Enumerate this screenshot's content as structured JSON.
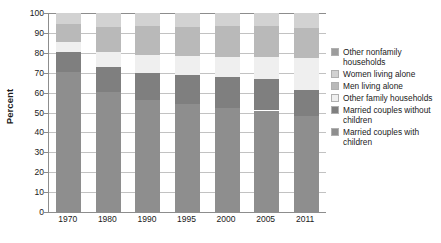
{
  "chart_data": {
    "type": "bar",
    "subtype": "stacked-bar-100-percent",
    "title": "",
    "xlabel": "",
    "ylabel": "Percent",
    "ylim": [
      0,
      100
    ],
    "yticks": [
      0,
      10,
      20,
      30,
      40,
      50,
      60,
      70,
      80,
      90,
      100
    ],
    "grid": true,
    "legend_position": "right",
    "categories": [
      "1970",
      "1980",
      "1990",
      "1995",
      "2000",
      "2005",
      "2011"
    ],
    "series": [
      {
        "name": "Married couples with children",
        "color": "#8e8e8e",
        "values": [
          40.3,
          30.9,
          26.3,
          25.5,
          24.1,
          22.9,
          20.6
        ]
      },
      {
        "name": "Married couples without children",
        "color": "#7f7f7f",
        "values": [
          30.3,
          29.9,
          29.8,
          28.9,
          28.7,
          28.2,
          28.2
        ]
      },
      {
        "name": "Other family households",
        "color": "#efefef",
        "values": [
          10.6,
          12.9,
          14.8,
          15.5,
          16.0,
          16.4,
          16.8
        ]
      },
      {
        "name": "Men living alone",
        "color": "#b9b9b9",
        "values": [
          5.6,
          8.6,
          9.7,
          10.2,
          10.7,
          11.3,
          11.7
        ]
      },
      {
        "name": "Women living alone",
        "color": "#d2d2d2",
        "values": [
          11.5,
          14.0,
          14.9,
          14.7,
          14.8,
          15.2,
          15.2
        ]
      },
      {
        "name": "Other nonfamily households",
        "color": "#9c9c9c",
        "values": [
          1.7,
          3.7,
          4.5,
          5.2,
          5.7,
          6.0,
          7.5
        ]
      }
    ],
    "cumulative_tops": {
      "1970": [
        70.5,
        80.5,
        85.5,
        94.5,
        100
      ],
      "1980": [
        60.5,
        73.0,
        80.5,
        93.0,
        100
      ],
      "1990": [
        56.5,
        70.0,
        79.0,
        93.5,
        100
      ],
      "1995": [
        54.5,
        69.0,
        78.5,
        93.0,
        100
      ],
      "2000": [
        52.5,
        68.0,
        78.0,
        93.5,
        100
      ],
      "2005": [
        51.0,
        67.0,
        78.0,
        93.5,
        100
      ],
      "2011": [
        48.0,
        61.5,
        77.5,
        92.5,
        100
      ]
    }
  },
  "legend": {
    "items": [
      {
        "label": "Other nonfamily households",
        "color": "#9c9c9c"
      },
      {
        "label": "Women living alone",
        "color": "#d2d2d2"
      },
      {
        "label": "Men living alone",
        "color": "#b9b9b9"
      },
      {
        "label": "Other family households",
        "color": "#efefef"
      },
      {
        "label": "Married couples without children",
        "color": "#7f7f7f"
      },
      {
        "label": "Married couples with children",
        "color": "#8e8e8e"
      }
    ]
  },
  "axis": {
    "y_title": "Percent",
    "y_tick_labels": [
      "100",
      "90",
      "80",
      "70",
      "60",
      "50",
      "40",
      "30",
      "20",
      "10",
      "0"
    ],
    "x_tick_labels": [
      "1970",
      "1980",
      "1990",
      "1995",
      "2000",
      "2005",
      "2011"
    ]
  }
}
